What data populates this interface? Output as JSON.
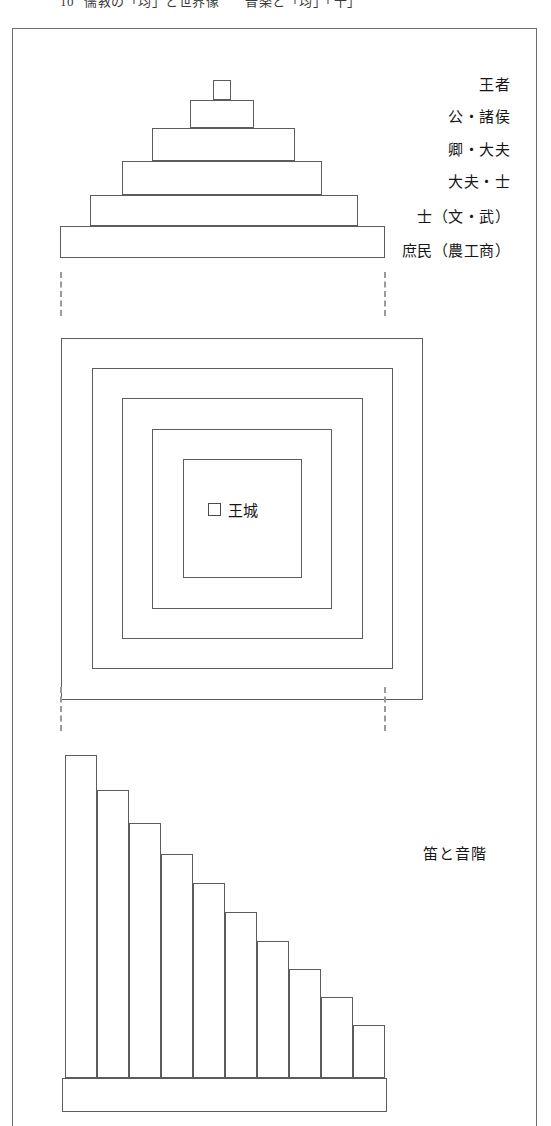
{
  "page": {
    "width": 551,
    "height": 1126,
    "background": "#ffffff",
    "ink": "#1c1c1c",
    "stroke": "#5c5c5c"
  },
  "running_head": {
    "number": "10",
    "title": "儒教の「均」と世界像",
    "subtitle": "音楽と「均」「十」",
    "clipped": true
  },
  "figure1": {
    "name": "social-hierarchy-pyramid",
    "tiers": [
      {
        "label": "王者",
        "x": 213,
        "y": 80,
        "w": 18,
        "h": 20
      },
      {
        "label": "公・諸侯",
        "x": 190,
        "y": 100,
        "w": 64,
        "h": 28
      },
      {
        "label": "卿・大夫",
        "x": 152,
        "y": 128,
        "w": 143,
        "h": 33
      },
      {
        "label": "大夫・士",
        "x": 122,
        "y": 161,
        "w": 200,
        "h": 34
      },
      {
        "label": "士（文・武）",
        "x": 90,
        "y": 195,
        "w": 268,
        "h": 31
      },
      {
        "label": "庶民（農工商）",
        "x": 60,
        "y": 226,
        "w": 325,
        "h": 32
      }
    ],
    "label_positions": [
      {
        "text": "王者",
        "right": 41,
        "top": 78
      },
      {
        "text": "公・諸侯",
        "right": 41,
        "top": 110
      },
      {
        "text": "卿・大夫",
        "right": 41,
        "top": 143
      },
      {
        "text": "大夫・士",
        "right": 41,
        "top": 175
      },
      {
        "text": "士（文・武）",
        "right": 41,
        "top": 210
      },
      {
        "text": "庶民（農工商）",
        "right": 41,
        "top": 244
      }
    ]
  },
  "separator1": {
    "name": "dashed-separator-upper",
    "left_x": 60,
    "right_x": 384,
    "top": 272,
    "height": 44
  },
  "figure2": {
    "name": "concentric-domains-diagram",
    "squares": [
      {
        "x": 61,
        "y": 338,
        "size": 362
      },
      {
        "x": 92,
        "y": 368,
        "size": 301
      },
      {
        "x": 122,
        "y": 398,
        "size": 241
      },
      {
        "x": 152,
        "y": 429,
        "size": 180
      },
      {
        "x": 183,
        "y": 459,
        "size": 119
      }
    ],
    "center_label": {
      "text": "王城",
      "icon": "small-square-icon",
      "x": 208,
      "y": 499
    }
  },
  "separator2": {
    "name": "dashed-separator-lower",
    "left_x": 60,
    "right_x": 384,
    "top": 687,
    "height": 44
  },
  "figure3": {
    "name": "flute-pitch-ladder",
    "label": "笛と音階",
    "label_x": 423,
    "label_y": 842,
    "base": {
      "x": 62,
      "y": 1078,
      "w": 325,
      "h": 34
    }
  },
  "chart_data": {
    "type": "bar",
    "title": "笛と音階",
    "xlabel": "",
    "ylabel": "",
    "grid": false,
    "legend": null,
    "orientation": "vertical",
    "note": "Descending stepped bars representing flute pipe lengths / pitch ladder",
    "categories": [
      "1",
      "2",
      "3",
      "4",
      "5",
      "6",
      "7",
      "8",
      "9",
      "10"
    ],
    "values": [
      323,
      288,
      255,
      224,
      195,
      166,
      137,
      109,
      81,
      53
    ],
    "ylim": [
      0,
      330
    ],
    "bar_geometry": {
      "left_x": 65,
      "baseline_y": 1078,
      "bar_width": 32,
      "bars": [
        {
          "x": 65,
          "y": 755,
          "w": 32,
          "h": 323
        },
        {
          "x": 97,
          "y": 790,
          "w": 32,
          "h": 288
        },
        {
          "x": 129,
          "y": 823,
          "w": 32,
          "h": 255
        },
        {
          "x": 161,
          "y": 854,
          "w": 32,
          "h": 224
        },
        {
          "x": 193,
          "y": 883,
          "w": 32,
          "h": 195
        },
        {
          "x": 225,
          "y": 912,
          "w": 32,
          "h": 166
        },
        {
          "x": 257,
          "y": 941,
          "w": 32,
          "h": 137
        },
        {
          "x": 289,
          "y": 969,
          "w": 32,
          "h": 109
        },
        {
          "x": 321,
          "y": 997,
          "w": 32,
          "h": 81
        },
        {
          "x": 353,
          "y": 1025,
          "w": 32,
          "h": 53
        }
      ]
    }
  }
}
